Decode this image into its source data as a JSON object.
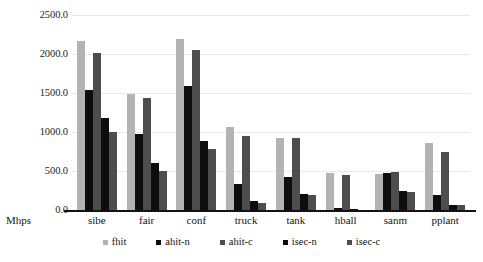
{
  "chart_data": {
    "type": "bar",
    "title": "",
    "subtitle": "",
    "xlabel": "Mhps",
    "ylabel": "",
    "ylim": [
      0,
      2500
    ],
    "grid": true,
    "legend_position": "bottom",
    "ytick_labels": [
      "0.0",
      "500.0",
      "1000.0",
      "1500.0",
      "2000.0",
      "2500.0"
    ],
    "ytick_values": [
      0,
      500,
      1000,
      1500,
      2000,
      2500
    ],
    "categories": [
      "sibe",
      "fair",
      "conf",
      "truck",
      "tank",
      "hball",
      "sanm",
      "pplant"
    ],
    "series": [
      {
        "name": "fhit",
        "color": "#b3b3b3",
        "values": [
          2165,
          1490,
          2195,
          1060,
          920,
          480,
          460,
          860
        ]
      },
      {
        "name": "ahit-n",
        "color": "#0d0d0d",
        "values": [
          1545,
          975,
          1595,
          330,
          420,
          30,
          470,
          190
        ]
      },
      {
        "name": "ahit-c",
        "color": "#4d4d4d",
        "values": [
          2010,
          1440,
          2055,
          950,
          920,
          450,
          490,
          750
        ]
      },
      {
        "name": "isec-n",
        "color": "#0d0d0d",
        "values": [
          1180,
          600,
          880,
          110,
          210,
          10,
          240,
          70
        ]
      },
      {
        "name": "isec-c",
        "color": "#4d4d4d",
        "values": [
          1000,
          495,
          780,
          90,
          190,
          5,
          225,
          70
        ]
      }
    ]
  },
  "legend": {
    "items": [
      {
        "label": "fhit"
      },
      {
        "label": "ahit-n"
      },
      {
        "label": "ahit-c"
      },
      {
        "label": "isec-n"
      },
      {
        "label": "isec-c"
      }
    ]
  }
}
